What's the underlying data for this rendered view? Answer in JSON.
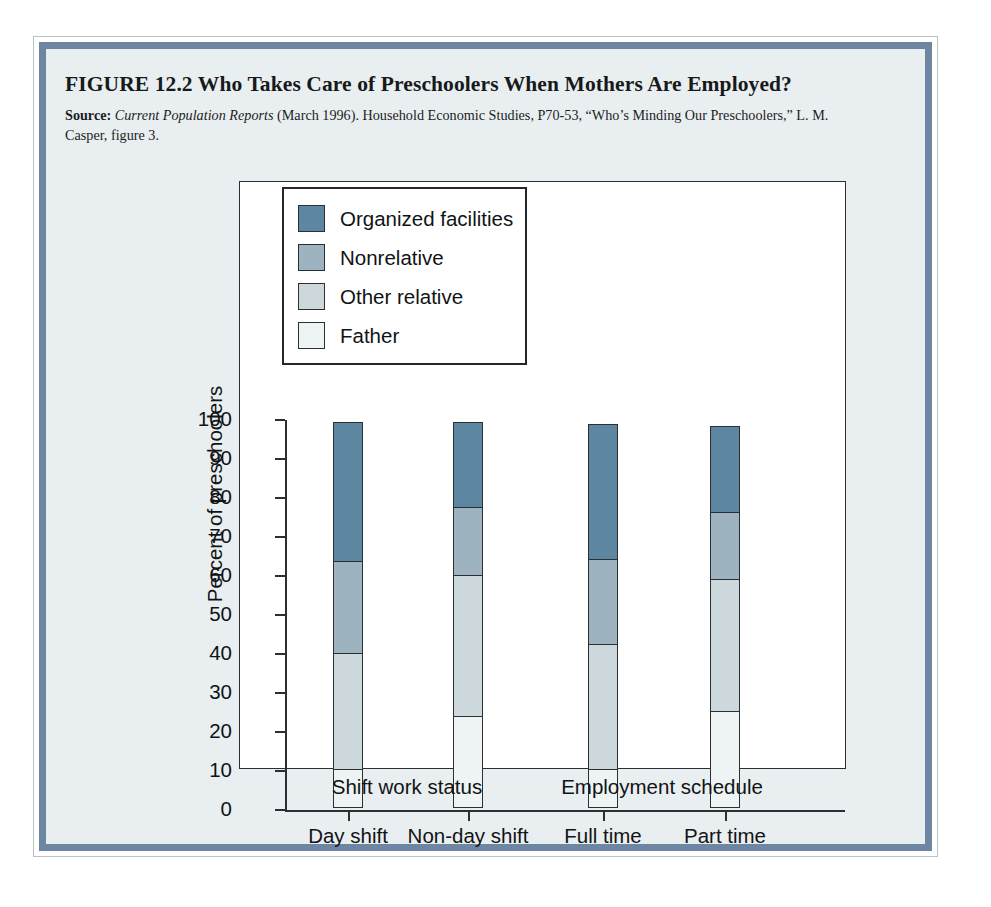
{
  "figure": {
    "title": "FIGURE 12.2  Who Takes Care of Preschoolers When Mothers Are Employed?",
    "source_label": "Source:",
    "source_italic": "Current Population Reports",
    "source_rest": " (March 1996). Household Economic Studies, P70-53, “Who’s Minding Our Preschoolers,” L. M. Casper, figure 3.",
    "border_color": "#6d87a2",
    "panel_background": "#e9eff0"
  },
  "chart_data": {
    "type": "bar",
    "subtype": "stacked-vertical",
    "title": "Who Takes Care of Preschoolers When Mothers Are Employed?",
    "xlabel": "",
    "ylabel": "Percent of preschoolers",
    "ylim": [
      0,
      100
    ],
    "yticks": [
      0,
      10,
      20,
      30,
      40,
      50,
      60,
      70,
      80,
      90,
      100
    ],
    "ytick_labels": [
      "0",
      "10",
      "20",
      "30",
      "40",
      "50",
      "60",
      "70",
      "80",
      "90",
      "100"
    ],
    "grid": false,
    "legend_position": "top-left-inside",
    "categories": [
      "Day shift",
      "Non-day shift",
      "Full time",
      "Part time"
    ],
    "group_labels": [
      "Shift work status",
      "Employment schedule"
    ],
    "series": [
      {
        "name": "Father",
        "color": "#eef3f3",
        "values": [
          10,
          23.5,
          10,
          25
        ]
      },
      {
        "name": "Other relative",
        "color": "#ccd8dc",
        "values": [
          30,
          36.5,
          32.5,
          34
        ]
      },
      {
        "name": "Nonrelative",
        "color": "#9db3c0",
        "values": [
          24,
          18,
          22,
          17.5
        ]
      },
      {
        "name": "Organized facilities",
        "color": "#5d87a1",
        "values": [
          36,
          22,
          35,
          22.5
        ]
      }
    ],
    "totals": [
      100,
      100,
      99.5,
      99
    ]
  },
  "legend": {
    "items": [
      {
        "label": "Organized facilities",
        "color": "#5d87a1"
      },
      {
        "label": "Nonrelative",
        "color": "#9db3c0"
      },
      {
        "label": "Other relative",
        "color": "#ccd8dc"
      },
      {
        "label": "Father",
        "color": "#eef3f3"
      }
    ]
  }
}
